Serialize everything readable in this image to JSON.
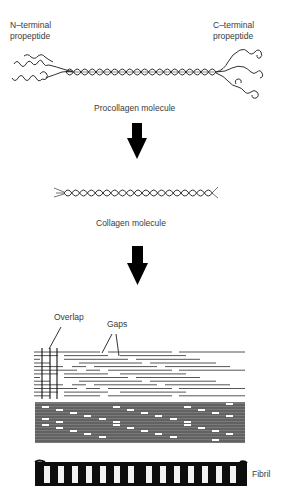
{
  "diagram": {
    "stages": [
      {
        "name": "Procollagen molecule",
        "labels": {
          "left_line1": "N–terminal",
          "left_line2": "propeptide",
          "right_line1": "C–terminal",
          "right_line2": "propeptide",
          "caption": "Procollagen molecule"
        }
      },
      {
        "name": "Collagen molecule",
        "labels": {
          "caption": "Collagen molecule"
        }
      },
      {
        "name": "Staggered array",
        "labels": {
          "overlap": "Overlap",
          "gaps": "Gaps"
        }
      },
      {
        "name": "Fibril",
        "labels": {
          "caption": "Fibril"
        }
      }
    ],
    "arrows": [
      {
        "from": "Procollagen molecule",
        "to": "Collagen molecule"
      },
      {
        "from": "Collagen molecule",
        "to": "Staggered array"
      }
    ],
    "fibril_bands": 14,
    "colors": {
      "ink": "#1a1a1a",
      "line_gray": "#6a6a6a",
      "label": "#3a3a3a"
    }
  }
}
